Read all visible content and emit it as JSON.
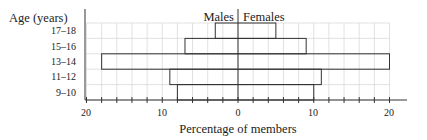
{
  "chart_data": {
    "type": "bar",
    "subtype": "population-pyramid",
    "title": "",
    "ylabel": "Age (years)",
    "xlabel": "Percentage of members",
    "categories": [
      "17–18",
      "15–16",
      "13–14",
      "11–12",
      "9–10"
    ],
    "series": [
      {
        "name": "Males",
        "values": [
          3,
          7,
          18,
          9,
          8
        ]
      },
      {
        "name": "Females",
        "values": [
          5,
          9,
          20,
          11,
          10
        ]
      }
    ],
    "x_ticks": [
      20,
      10,
      0,
      10,
      20
    ],
    "xlim": [
      -20,
      20
    ],
    "grid": true,
    "legend": {
      "left": "Males",
      "right": "Females",
      "position": "top-center"
    }
  },
  "labels": {
    "y_axis_title": "Age (years)",
    "x_axis_title": "Percentage of members",
    "males": "Males",
    "females": "Females",
    "tick_left_20": "20",
    "tick_left_10": "10",
    "tick_zero": "0",
    "tick_right_10": "10",
    "tick_right_20": "20"
  },
  "colors": {
    "grid": "#d9d9d9",
    "bar_stroke": "#333333",
    "axis": "#333333",
    "bar_fill": "#ffffff"
  }
}
